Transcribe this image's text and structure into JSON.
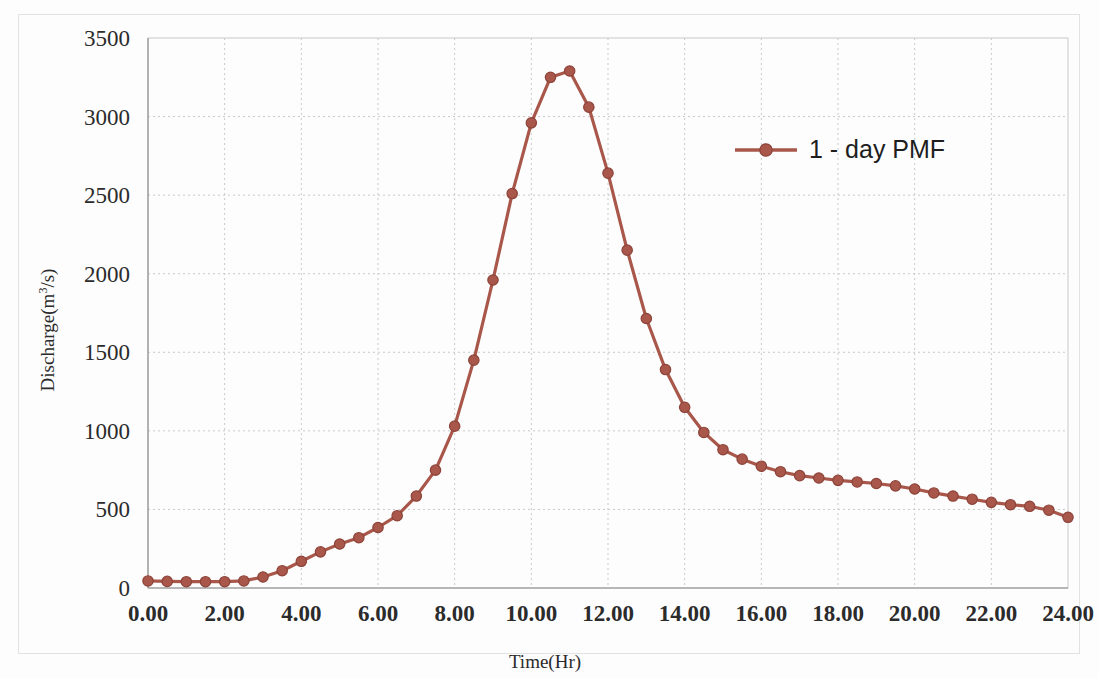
{
  "chart_data": {
    "type": "line",
    "title": "",
    "xlabel": "Time(Hr)",
    "ylabel": "Discharge(m3/s)",
    "ylabel_base": "Discharge(m",
    "ylabel_sup": "3",
    "ylabel_tail": "/s)",
    "xlim": [
      0,
      24
    ],
    "ylim": [
      0,
      3500
    ],
    "xtick_step": 2,
    "ytick_step": 500,
    "grid": true,
    "legend_position": "inside-top-right",
    "xticks": [
      "0.00",
      "2.00",
      "4.00",
      "6.00",
      "8.00",
      "10.00",
      "12.00",
      "14.00",
      "16.00",
      "18.00",
      "20.00",
      "22.00",
      "24.00"
    ],
    "yticks": [
      "0",
      "500",
      "1000",
      "1500",
      "2000",
      "2500",
      "3000",
      "3500"
    ],
    "series": [
      {
        "name": "1 - day PMF",
        "color": "#A8574A",
        "marker": "circle",
        "x": [
          0,
          0.5,
          1,
          1.5,
          2,
          2.5,
          3,
          3.5,
          4,
          4.5,
          5,
          5.5,
          6,
          6.5,
          7,
          7.5,
          8,
          8.5,
          9,
          9.5,
          10,
          10.5,
          11,
          11.5,
          12,
          12.5,
          13,
          13.5,
          14,
          14.5,
          15,
          15.5,
          16,
          16.5,
          17,
          17.5,
          18,
          18.5,
          19,
          19.5,
          20,
          20.5,
          21,
          21.5,
          22,
          22.5,
          23,
          23.5,
          24
        ],
        "y": [
          45,
          42,
          40,
          40,
          40,
          45,
          70,
          110,
          170,
          230,
          280,
          320,
          385,
          460,
          585,
          750,
          1030,
          1450,
          1960,
          2510,
          2960,
          3250,
          3290,
          3060,
          2640,
          2150,
          1715,
          1390,
          1150,
          990,
          880,
          820,
          775,
          740,
          715,
          700,
          685,
          675,
          665,
          650,
          630,
          605,
          585,
          565,
          545,
          530,
          520,
          495,
          450
        ]
      }
    ],
    "legend_entries": [
      {
        "label": "1 - day PMF",
        "color": "#A8574A"
      }
    ]
  },
  "layout": {
    "plot_left": 148,
    "plot_right": 1068,
    "plot_top": 38,
    "plot_bottom": 588,
    "legend_x": 735,
    "legend_y": 150
  }
}
